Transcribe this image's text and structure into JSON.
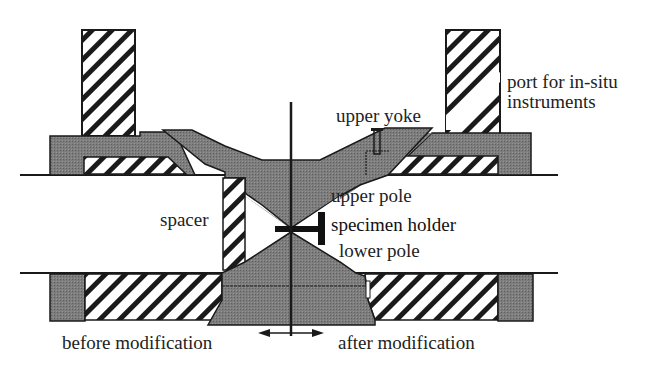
{
  "diagram": {
    "colors": {
      "iron_fill": "#7a7a7a",
      "hatch_line": "#1a1a1a",
      "outline": "#1a1a1a",
      "background": "#ffffff",
      "text": "#222222"
    },
    "labels": {
      "port": "port for in-situ",
      "port_line2": "instruments",
      "upper_yoke": "upper yoke",
      "upper_pole": "upper pole",
      "specimen_holder": "specimen holder",
      "lower_pole": "lower pole",
      "spacer": "spacer",
      "before": "before modification",
      "after": "after modification"
    },
    "components": [
      {
        "name": "left-coil-tower",
        "style": "hatched"
      },
      {
        "name": "right-coil-tower",
        "style": "hatched",
        "note": "with in-situ port channel"
      },
      {
        "name": "upper-left-flange",
        "style": "iron"
      },
      {
        "name": "upper-right-flange",
        "style": "iron"
      },
      {
        "name": "upper-yoke",
        "style": "iron"
      },
      {
        "name": "upper-pole",
        "style": "iron"
      },
      {
        "name": "specimen-holder",
        "style": "solid-black"
      },
      {
        "name": "spacer",
        "style": "hatched"
      },
      {
        "name": "lower-pole",
        "style": "iron"
      },
      {
        "name": "lower-left-coil",
        "style": "hatched"
      },
      {
        "name": "lower-right-coil",
        "style": "hatched"
      },
      {
        "name": "optical-axis",
        "style": "line"
      },
      {
        "name": "comparison-arrow",
        "style": "double-arrow"
      }
    ]
  }
}
